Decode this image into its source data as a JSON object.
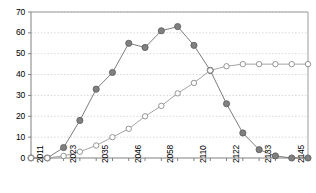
{
  "chart_data": {
    "type": "line",
    "title": "",
    "xlabel": "",
    "ylabel": "",
    "ylim": [
      0,
      70
    ],
    "yticks": [
      0,
      10,
      20,
      30,
      40,
      50,
      60,
      70
    ],
    "grid": true,
    "legend": null,
    "x": [
      "2011",
      "2017",
      "2023",
      "2029",
      "2035",
      "2041",
      "2046",
      "2052",
      "2058",
      "2064",
      "2110",
      "2116",
      "2122",
      "2128",
      "2133",
      "2139",
      "2145",
      "2151"
    ],
    "xtick_labels": [
      "2011",
      "2023",
      "2035",
      "2046",
      "2058",
      "2110",
      "2122",
      "2133",
      "2145"
    ],
    "xtick_labels_all": [
      "2011",
      "",
      "2023",
      "",
      "2035",
      "",
      "2046",
      "",
      "2058",
      "",
      "2110",
      "",
      "2122",
      "",
      "2133",
      "",
      "2145",
      ""
    ],
    "series": [
      {
        "name": "filled-series",
        "marker": "filled-circle",
        "color": "#6e6e6e",
        "values": [
          0,
          0,
          5,
          18,
          33,
          41,
          55,
          53,
          61,
          63,
          54,
          42,
          26,
          12,
          4,
          1,
          0,
          0
        ]
      },
      {
        "name": "open-series",
        "marker": "open-circle",
        "color": "#9a9a9a",
        "values": [
          0,
          0,
          1,
          3,
          6,
          10,
          14,
          20,
          25,
          31,
          36,
          42,
          44,
          45,
          45,
          45,
          45,
          45
        ]
      }
    ]
  },
  "axes": {
    "y_max_label": "70",
    "y_min_label": "0"
  }
}
